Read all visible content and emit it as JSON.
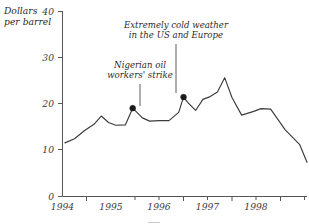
{
  "chart_data": {
    "type": "line",
    "title": "",
    "subtitle": "",
    "xlabel": "",
    "ylabel": "Dollars per barrel",
    "ylabel_line1": "Dollars",
    "ylabel_line2": "per barrel",
    "xlim": [
      1993.5,
      1998.55
    ],
    "ylim": [
      0,
      40
    ],
    "grid": false,
    "legend": "none",
    "y_ticks": [
      0,
      10,
      20,
      30,
      40
    ],
    "y_tick_labels": [
      "0",
      "10",
      "20",
      "30",
      "40"
    ],
    "x_ticks": [
      1994,
      1995,
      1996,
      1997,
      1998
    ],
    "x_tick_labels": [
      "1994",
      "1995",
      "1996",
      "1997",
      "1998"
    ],
    "x_minor_ticks": [
      1994.5,
      1995.5,
      1996.5,
      1997.5
    ],
    "series": [
      {
        "name": "Crude oil price",
        "x": [
          1993.55,
          1993.75,
          1993.95,
          1994.15,
          1994.3,
          1994.45,
          1994.6,
          1994.8,
          1994.95,
          1995.15,
          1995.3,
          1995.5,
          1995.7,
          1995.9,
          1996.0,
          1996.1,
          1996.25,
          1996.4,
          1996.55,
          1996.7,
          1996.85,
          1997.0,
          1997.2,
          1997.45,
          1997.6,
          1997.8,
          1998.1,
          1998.4,
          1998.55
        ],
        "y": [
          11.6,
          12.5,
          14.2,
          15.6,
          17.4,
          16.0,
          15.4,
          15.5,
          19.1,
          17.0,
          16.3,
          16.4,
          16.4,
          18.2,
          21.5,
          20.2,
          18.6,
          21.0,
          21.6,
          22.6,
          25.7,
          21.4,
          17.6,
          18.4,
          19.0,
          18.9,
          14.4,
          11.2,
          7.4
        ]
      }
    ],
    "markers": [
      {
        "x": 1994.95,
        "y": 19.1,
        "label": "Nigerian oil workers' strike"
      },
      {
        "x": 1996.0,
        "y": 21.5,
        "label": "Extremely cold weather in the US and Europe"
      }
    ],
    "annotations": [
      {
        "id": "nigeria",
        "line1": "Nigerian oil",
        "line2": "workers' strike",
        "text_x": 140,
        "text_y": 76,
        "anchor": "middle",
        "leader": {
          "x1": 140,
          "y1": 83,
          "x2": 140,
          "y2": 105
        }
      },
      {
        "id": "cold-weather",
        "line1": "Extremely cold weather",
        "line2": "in the US and Europe",
        "text_x": 176,
        "text_y": 36,
        "anchor": "middle",
        "leader": {
          "x1": 176,
          "y1": 43,
          "x2": 176,
          "y2": 92
        }
      }
    ],
    "colors": {
      "line": "#3c3c3c",
      "axis": "#55555a",
      "marker": "#1a1a1a",
      "text": "#2b2b2b",
      "background": "#ffffff"
    }
  }
}
